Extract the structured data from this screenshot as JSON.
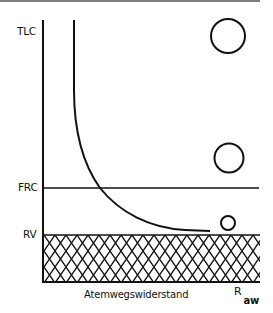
{
  "diagram": {
    "y_labels": {
      "tlc": "TLC",
      "frc": "FRC",
      "rv": "RV"
    },
    "x_label": "Atemwegswiderstand",
    "x_symbol": {
      "main": "R",
      "subscript": "aw"
    },
    "elements": {
      "curve": "airway resistance vs lung volume (hyperbolic)",
      "circles": [
        {
          "level": "near TLC",
          "size": "large"
        },
        {
          "level": "above FRC",
          "size": "medium"
        },
        {
          "level": "near RV",
          "size": "small"
        }
      ],
      "hatched_region": "below RV (residual volume)"
    },
    "colors": {
      "line": "#111111",
      "background": "#ffffff"
    }
  }
}
